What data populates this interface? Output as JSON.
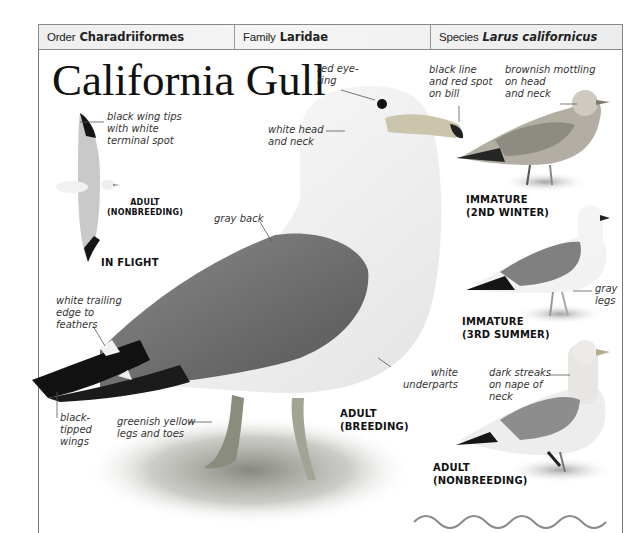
{
  "taxonomy": {
    "order": {
      "key": "Order",
      "value": "Charadriiformes"
    },
    "family": {
      "key": "Family",
      "value": "Laridae"
    },
    "species": {
      "key": "Species",
      "value": "Larus californicus"
    }
  },
  "title": "California Gull",
  "annotations": {
    "red_eye_ring": [
      "red eye-",
      "ring"
    ],
    "white_head": [
      "white head",
      "and neck"
    ],
    "bill": [
      "black line",
      "and red spot",
      "on bill"
    ],
    "brownish_mottling": [
      "brownish mottling",
      "on head",
      "and neck"
    ],
    "wing_tips": [
      "black wing tips",
      "with white",
      "terminal spot"
    ],
    "gray_back": [
      "gray back"
    ],
    "trailing_edge": [
      "white trailing",
      "edge to",
      "feathers"
    ],
    "black_tipped": [
      "black-",
      "tipped",
      "wings"
    ],
    "legs_toes": [
      "greenish yellow",
      "legs and toes"
    ],
    "underparts": [
      "white",
      "underparts"
    ],
    "gray_legs": [
      "gray",
      "legs"
    ],
    "dark_streaks": [
      "dark streaks",
      "on nape of",
      "neck"
    ]
  },
  "captions": {
    "flight_adult": [
      "ADULT",
      "(NONBREEDING)"
    ],
    "in_flight": "IN FLIGHT",
    "immature_2nd": [
      "IMMATURE",
      "(2ND WINTER)"
    ],
    "immature_3rd": [
      "IMMATURE",
      "(3RD SUMMER)"
    ],
    "adult_breeding": [
      "ADULT",
      "(BREEDING)"
    ],
    "adult_nonbreeding": [
      "ADULT",
      "(NONBREEDING)"
    ]
  },
  "colors": {
    "header_bg": "#eeeeee",
    "border": "#888888",
    "mantle_gray": "#7d7d7d",
    "wingtip_black": "#1a1a1a",
    "bill_yellow": "#c8c2a8",
    "leg_green": "#a9ad96"
  }
}
